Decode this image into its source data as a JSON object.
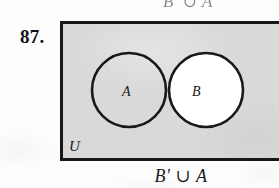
{
  "figure": {
    "exercise_number": "87.",
    "top_partial_caption": "B' ∪ A",
    "bottom_caption": "B' ∪ A",
    "universe_label": "U",
    "set_labels": {
      "a": "A",
      "b": "B"
    },
    "diagram_type": "venn-diagram",
    "region_shading": {
      "universe_outside_circles": "shaded",
      "a_only": "shaded",
      "a_intersect_b": "shaded",
      "b_only": "unshaded"
    },
    "colors": {
      "page_background": "#fdfdfd",
      "shaded_region": "#d9d9d9",
      "unshaded_region": "#ffffff",
      "stroke": "#18181b",
      "text": "#18181b"
    }
  }
}
